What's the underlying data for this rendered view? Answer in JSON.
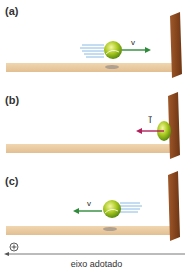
{
  "panels": [
    {
      "label": "(a)",
      "vector_label": "v",
      "vector_direction": "right",
      "description": "ball moving toward wall"
    },
    {
      "label": "(b)",
      "vector_label": "I⃗",
      "vector_direction": "left",
      "description": "ball compressed against wall, impulse"
    },
    {
      "label": "(c)",
      "vector_label": "v",
      "vector_direction": "left",
      "description": "ball moving away from wall"
    }
  ],
  "axis": {
    "sign": "+",
    "label": "eixo adotado",
    "direction": "left"
  },
  "colors": {
    "floor": "#e8c9a0",
    "wall": "#8b4a1e",
    "ball": "#a8c81e",
    "velocity_arrow": "#2e8b3a",
    "impulse_arrow": "#b0205a",
    "motion_lines": "#6aa8e0"
  }
}
